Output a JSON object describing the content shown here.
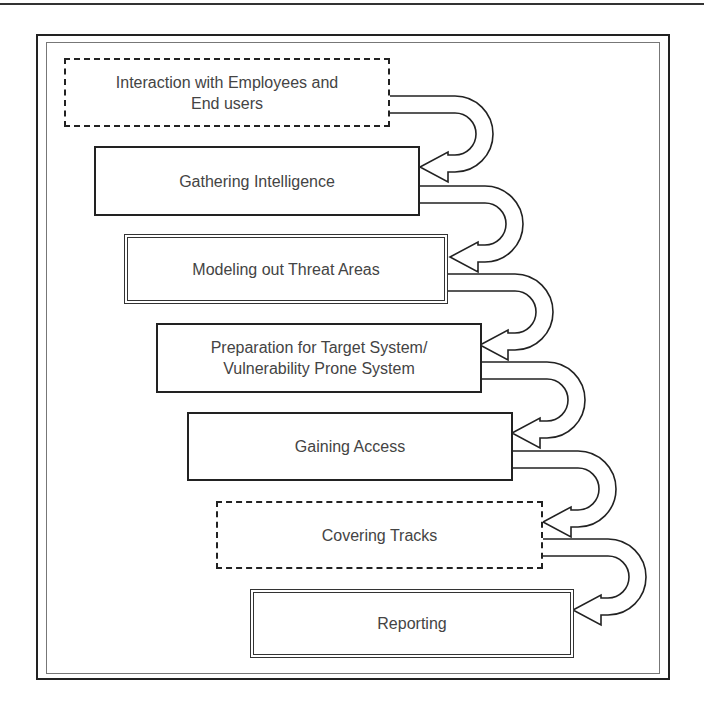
{
  "diagram": {
    "type": "process-flow",
    "direction": "top-to-bottom staircase with curved connector arrows",
    "steps": [
      {
        "id": 1,
        "label_line1": "Interaction with Employees and",
        "label_line2": "End users",
        "border_style": "dashed"
      },
      {
        "id": 2,
        "label_line1": "Gathering Intelligence",
        "label_line2": "",
        "border_style": "solid"
      },
      {
        "id": 3,
        "label_line1": "Modeling out Threat Areas",
        "label_line2": "",
        "border_style": "double"
      },
      {
        "id": 4,
        "label_line1": "Preparation for Target System/",
        "label_line2": "Vulnerability Prone System",
        "border_style": "solid"
      },
      {
        "id": 5,
        "label_line1": "Gaining Access",
        "label_line2": "",
        "border_style": "solid"
      },
      {
        "id": 6,
        "label_line1": "Covering Tracks",
        "label_line2": "",
        "border_style": "dashed"
      },
      {
        "id": 7,
        "label_line1": "Reporting",
        "label_line2": "",
        "border_style": "double"
      }
    ],
    "connectors": [
      {
        "from": 1,
        "to": 2,
        "shape": "curved-u-arrow"
      },
      {
        "from": 2,
        "to": 3,
        "shape": "curved-u-arrow"
      },
      {
        "from": 3,
        "to": 4,
        "shape": "curved-u-arrow"
      },
      {
        "from": 4,
        "to": 5,
        "shape": "curved-u-arrow"
      },
      {
        "from": 5,
        "to": 6,
        "shape": "curved-u-arrow"
      },
      {
        "from": 6,
        "to": 7,
        "shape": "curved-u-arrow"
      }
    ],
    "colors": {
      "text": "#444444",
      "stroke": "#222222",
      "background": "#ffffff"
    }
  }
}
